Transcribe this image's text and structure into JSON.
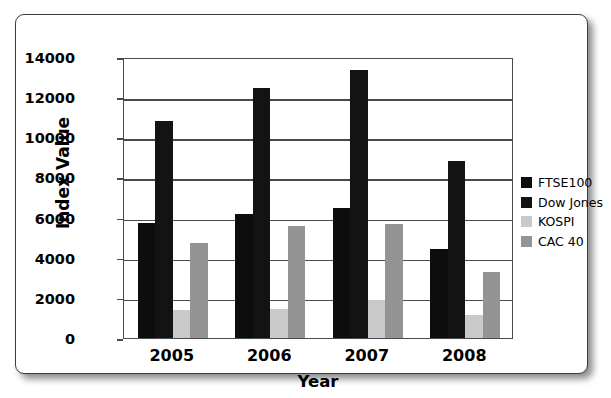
{
  "chart_data": {
    "type": "bar",
    "title": "",
    "xlabel": "Year",
    "ylabel": "Index Value",
    "categories": [
      "2005",
      "2006",
      "2007",
      "2008"
    ],
    "ylim": [
      0,
      14000
    ],
    "ytick_values": [
      0,
      2000,
      4000,
      6000,
      8000,
      10000,
      12000,
      14000
    ],
    "ytick_labels": [
      "0",
      "2000",
      "4000",
      "6000",
      "8000",
      "10000",
      "12000",
      "14000"
    ],
    "grid": true,
    "legend_position": "right",
    "series": [
      {
        "name": "FTSE100",
        "color": "#0d0d0d",
        "values": [
          5750,
          6200,
          6500,
          4450
        ]
      },
      {
        "name": "Dow Jones",
        "color": "#131313",
        "values": [
          10800,
          12450,
          13350,
          8800
        ]
      },
      {
        "name": "KOSPI",
        "color": "#c9c9c9",
        "values": [
          1400,
          1430,
          1880,
          1130
        ]
      },
      {
        "name": "CAC 40",
        "color": "#949494",
        "values": [
          4750,
          5600,
          5700,
          3300
        ]
      }
    ]
  },
  "colors": {
    "frame_border": "#3c3c3c",
    "axis": "#4a4a4a",
    "background": "#ffffff",
    "text": "#000000"
  }
}
